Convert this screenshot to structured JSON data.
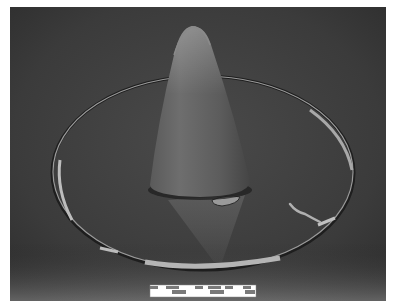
{
  "image": {
    "subject": "Conical object standing inside a thin oval ring on a dark backdrop",
    "background_color": "#3e3e3e",
    "frame_color": "#ffffff"
  },
  "scale_bar": {
    "segments": 8,
    "colors": [
      "#ffffff",
      "#7a7a7a"
    ]
  }
}
